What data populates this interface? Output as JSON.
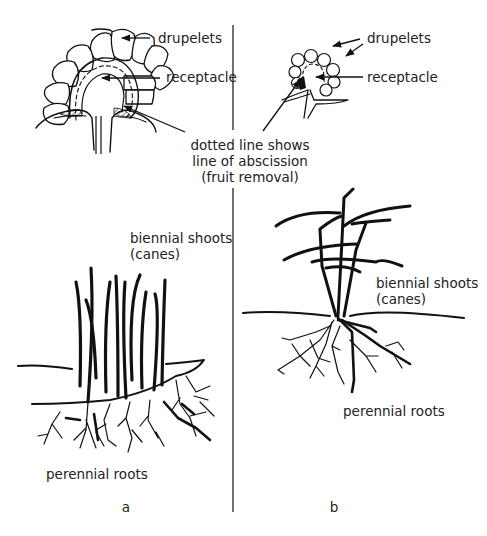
{
  "figure": {
    "panel_a": {
      "caption": "a",
      "fruit_labels": {
        "drupelets": "drupelets",
        "receptacle": "receptacle"
      },
      "plant_labels": {
        "shoots_line1": "biennial shoots",
        "shoots_line2": "(canes)",
        "roots": "perennial roots"
      }
    },
    "panel_b": {
      "caption": "b",
      "fruit_labels": {
        "drupelets": "drupelets",
        "receptacle": "receptacle"
      },
      "plant_labels": {
        "shoots_line1": "biennial shoots",
        "shoots_line2": "(canes)",
        "roots": "perennial roots"
      }
    },
    "shared_note": {
      "line1": "dotted line shows",
      "line2": "line of abscission",
      "line3": "(fruit removal)"
    },
    "colors": {
      "ink": "#111111",
      "text": "#222222",
      "background": "#ffffff"
    }
  }
}
